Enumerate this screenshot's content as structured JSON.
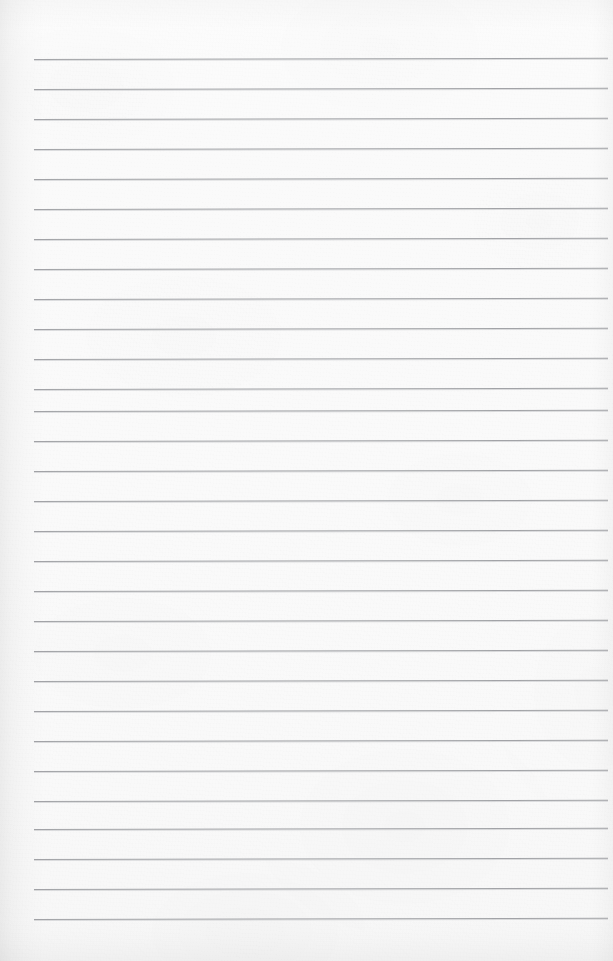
{
  "document": {
    "title": "Lined Notebook Page",
    "kind": "blank-ruled-paper-scan",
    "written_content": "",
    "page_number": "",
    "header_text": "",
    "footer_text": ""
  },
  "page": {
    "width_px": 613,
    "height_px": 961,
    "background_color": "#fbfbfb",
    "paper_tone": "off-white",
    "texture": "fine paper grain with soft scanner mottling"
  },
  "ruling": {
    "line_color": "#8f9195",
    "line_thickness_px": 1,
    "line_spacing_px": 30,
    "first_line_y_px": 59,
    "line_count": 30,
    "left_margin_x_px": 34,
    "right_end_x_px": 608,
    "skew_deg": -0.12,
    "margin_rule": "none",
    "lines": [
      {
        "index": 1,
        "y": 59
      },
      {
        "index": 2,
        "y": 89
      },
      {
        "index": 3,
        "y": 119
      },
      {
        "index": 4,
        "y": 149
      },
      {
        "index": 5,
        "y": 179
      },
      {
        "index": 6,
        "y": 209
      },
      {
        "index": 7,
        "y": 239
      },
      {
        "index": 8,
        "y": 269
      },
      {
        "index": 9,
        "y": 299
      },
      {
        "index": 10,
        "y": 329
      },
      {
        "index": 11,
        "y": 359
      },
      {
        "index": 12,
        "y": 389
      },
      {
        "index": 13,
        "y": 411
      },
      {
        "index": 14,
        "y": 441
      },
      {
        "index": 15,
        "y": 471
      },
      {
        "index": 16,
        "y": 501
      },
      {
        "index": 17,
        "y": 531
      },
      {
        "index": 18,
        "y": 561
      },
      {
        "index": 19,
        "y": 591
      },
      {
        "index": 20,
        "y": 621
      },
      {
        "index": 21,
        "y": 651
      },
      {
        "index": 22,
        "y": 681
      },
      {
        "index": 23,
        "y": 711
      },
      {
        "index": 24,
        "y": 741
      },
      {
        "index": 25,
        "y": 771
      },
      {
        "index": 26,
        "y": 801
      },
      {
        "index": 27,
        "y": 829
      },
      {
        "index": 28,
        "y": 859
      },
      {
        "index": 29,
        "y": 889
      },
      {
        "index": 30,
        "y": 919
      }
    ]
  },
  "edges": {
    "left_shadow": true,
    "right_shadow": true,
    "top_shadow": true,
    "bottom_shadow": true
  }
}
